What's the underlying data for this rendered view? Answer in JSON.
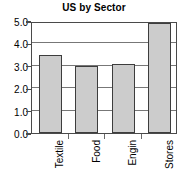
{
  "chart_data": {
    "type": "bar",
    "title": "US by Sector",
    "categories": [
      "Textile",
      "Food",
      "Engin",
      "Stores"
    ],
    "values": [
      3.5,
      3.0,
      3.1,
      4.9
    ],
    "xlabel": "",
    "ylabel": "",
    "ylim": [
      0.0,
      5.0
    ],
    "ytick_labels": [
      "0.0",
      "1.0",
      "2.0",
      "3.0",
      "4.0",
      "5.0"
    ],
    "ytick_values": [
      0.0,
      1.0,
      2.0,
      3.0,
      4.0,
      5.0
    ],
    "grid": true,
    "legend": false,
    "bar_color": "#cccccc",
    "bar_border_color": "#3d3d3d",
    "axis_color": "#4a4a4a",
    "grid_color": "#777777",
    "label_rotation": -90
  }
}
